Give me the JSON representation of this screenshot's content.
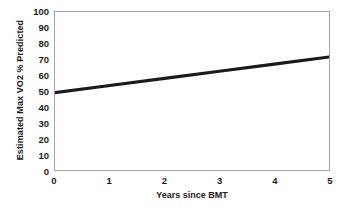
{
  "chart_data": {
    "type": "line",
    "title": "",
    "xlabel": "Years since BMT",
    "ylabel": "Estimated Max VO2 % Predicted",
    "xlim": [
      0,
      5
    ],
    "ylim": [
      0,
      100
    ],
    "xticks": [
      "0",
      "1",
      "2",
      "3",
      "4",
      "5"
    ],
    "yticks": [
      "100",
      "90",
      "80",
      "70",
      "60",
      "50",
      "40",
      "30",
      "20",
      "10",
      "0"
    ],
    "grid": false,
    "legend": null,
    "series": [
      {
        "name": "Estimated Max VO2 % Predicted",
        "color": "#1a1a1a",
        "x": [
          0,
          1,
          2,
          3,
          4,
          5
        ],
        "values": [
          49.0,
          53.5,
          58.0,
          62.5,
          67.0,
          71.5
        ]
      }
    ]
  },
  "figure": {
    "background_color": "#ffffff",
    "frame_color": "#a6a6a6",
    "text_color": "#1a1a1a"
  }
}
